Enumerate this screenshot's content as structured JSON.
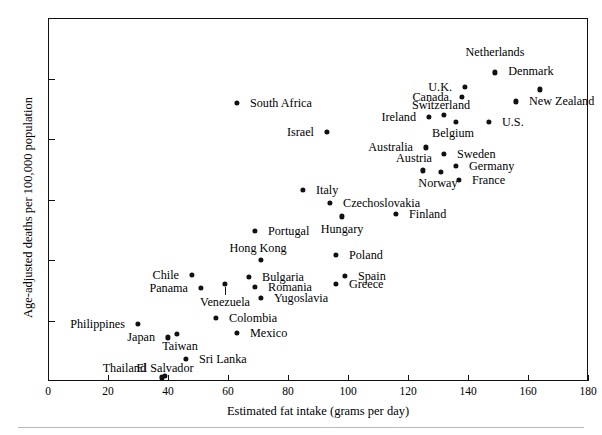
{
  "chart_data": {
    "type": "scatter",
    "title": "",
    "xlabel": "Estimated fat intake (grams per day)",
    "ylabel": "Age-adjusted deaths per 100,000 population",
    "xlim": [
      0,
      180
    ],
    "ylim": [
      0,
      30
    ],
    "xticks": [
      0,
      20,
      40,
      60,
      80,
      100,
      120,
      140,
      160,
      180
    ],
    "yticks": [
      0,
      5,
      10,
      15,
      20,
      25,
      30
    ],
    "grid": false,
    "legend": "none",
    "marker": "filled-circle",
    "marker_color": "#111111",
    "points": [
      {
        "label": "Netherlands",
        "x": 149,
        "y": 25.5,
        "lx": 149,
        "ly": 27.2,
        "lpos": "c"
      },
      {
        "label": "U.K.",
        "x": 139,
        "y": 24.3,
        "lx": 136,
        "ly": 24.3,
        "lpos": "r"
      },
      {
        "label": "Denmark",
        "x": 164,
        "y": 24.1,
        "lx": 161,
        "ly": 25.6,
        "lpos": "c"
      },
      {
        "label": "Canada",
        "x": 138,
        "y": 23.5,
        "lx": 135,
        "ly": 23.5,
        "lpos": "r"
      },
      {
        "label": "New Zealand",
        "x": 156,
        "y": 23.1,
        "lx": 159,
        "ly": 23.1,
        "lpos": "l"
      },
      {
        "label": "Switzerland",
        "x": 132,
        "y": 22.0,
        "lx": 131,
        "ly": 22.8,
        "lpos": "c"
      },
      {
        "label": "Ireland",
        "x": 127,
        "y": 21.8,
        "lx": 124,
        "ly": 21.8,
        "lpos": "r"
      },
      {
        "label": "Belgium",
        "x": 136,
        "y": 21.4,
        "lx": 135,
        "ly": 20.5,
        "lpos": "c"
      },
      {
        "label": "U.S.",
        "x": 147,
        "y": 21.4,
        "lx": 150,
        "ly": 21.4,
        "lpos": "l"
      },
      {
        "label": "Australia",
        "x": 126,
        "y": 19.3,
        "lx": 123,
        "ly": 19.3,
        "lpos": "r"
      },
      {
        "label": "Sweden",
        "x": 132,
        "y": 18.8,
        "lx": 135,
        "ly": 18.8,
        "lpos": "l"
      },
      {
        "label": "Germany",
        "x": 136,
        "y": 17.8,
        "lx": 139,
        "ly": 17.8,
        "lpos": "l"
      },
      {
        "label": "Austria",
        "x": 125,
        "y": 17.4,
        "lx": 122,
        "ly": 18.4,
        "lpos": "c"
      },
      {
        "label": "Norway",
        "x": 131,
        "y": 17.3,
        "lx": 130,
        "ly": 16.4,
        "lpos": "c"
      },
      {
        "label": "France",
        "x": 137,
        "y": 16.6,
        "lx": 140,
        "ly": 16.6,
        "lpos": "l"
      },
      {
        "label": "South Africa",
        "x": 63,
        "y": 23.0,
        "lx": 66,
        "ly": 23.0,
        "lpos": "l"
      },
      {
        "label": "Israel",
        "x": 93,
        "y": 20.6,
        "lx": 90,
        "ly": 20.6,
        "lpos": "r"
      },
      {
        "label": "Italy",
        "x": 85,
        "y": 15.8,
        "lx": 88,
        "ly": 15.8,
        "lpos": "l"
      },
      {
        "label": "Czechoslovakia",
        "x": 94,
        "y": 14.7,
        "lx": 97,
        "ly": 14.7,
        "lpos": "l"
      },
      {
        "label": "Finland",
        "x": 116,
        "y": 13.8,
        "lx": 119,
        "ly": 13.8,
        "lpos": "l"
      },
      {
        "label": "Hungary",
        "x": 98,
        "y": 13.6,
        "lx": 98,
        "ly": 12.6,
        "lpos": "c"
      },
      {
        "label": "Portugal",
        "x": 69,
        "y": 12.4,
        "lx": 72,
        "ly": 12.4,
        "lpos": "l"
      },
      {
        "label": "Poland",
        "x": 96,
        "y": 10.4,
        "lx": 99,
        "ly": 10.4,
        "lpos": "l"
      },
      {
        "label": "Hong Kong",
        "x": 71,
        "y": 10.0,
        "lx": 70,
        "ly": 11.0,
        "lpos": "c"
      },
      {
        "label": "Chile",
        "x": 48,
        "y": 8.8,
        "lx": 45,
        "ly": 8.8,
        "lpos": "r"
      },
      {
        "label": "Spain",
        "x": 99,
        "y": 8.7,
        "lx": 102,
        "ly": 8.7,
        "lpos": "l"
      },
      {
        "label": "Bulgaria",
        "x": 67,
        "y": 8.6,
        "lx": 70,
        "ly": 8.6,
        "lpos": "l"
      },
      {
        "label": "Greece",
        "x": 96,
        "y": 8.0,
        "lx": 99,
        "ly": 8.0,
        "lpos": "l"
      },
      {
        "label": "Romania",
        "x": 69,
        "y": 7.8,
        "lx": 72,
        "ly": 7.8,
        "lpos": "l"
      },
      {
        "label": "Panama",
        "x": 51,
        "y": 7.7,
        "lx": 48,
        "ly": 7.7,
        "lpos": "r"
      },
      {
        "label": "Yugoslavia",
        "x": 71,
        "y": 6.9,
        "lx": 74,
        "ly": 6.9,
        "lpos": "l"
      },
      {
        "label": "Venezuela",
        "x": 59,
        "y": 8.0,
        "lx": 59,
        "ly": 6.5,
        "lpos": "c",
        "leader": true
      },
      {
        "label": "Colombia",
        "x": 56,
        "y": 5.2,
        "lx": 59,
        "ly": 5.2,
        "lpos": "l"
      },
      {
        "label": "Philippines",
        "x": 30,
        "y": 4.7,
        "lx": 27,
        "ly": 4.7,
        "lpos": "r"
      },
      {
        "label": "Mexico",
        "x": 63,
        "y": 4.0,
        "lx": 66,
        "ly": 4.0,
        "lpos": "l"
      },
      {
        "label": "Taiwan",
        "x": 43,
        "y": 3.9,
        "lx": 44,
        "ly": 2.9,
        "lpos": "c"
      },
      {
        "label": "Japan",
        "x": 40,
        "y": 3.6,
        "lx": 37,
        "ly": 3.6,
        "lpos": "r"
      },
      {
        "label": "Sri Lanka",
        "x": 46,
        "y": 1.8,
        "lx": 49,
        "ly": 1.8,
        "lpos": "l"
      },
      {
        "label": "El Salvador",
        "x": 39,
        "y": 0.4,
        "lx": 39,
        "ly": 1.1,
        "lpos": "c"
      },
      {
        "label": "Thailand",
        "x": 38,
        "y": 0.3,
        "lx": 34,
        "ly": 1.1,
        "lpos": "r"
      }
    ]
  }
}
